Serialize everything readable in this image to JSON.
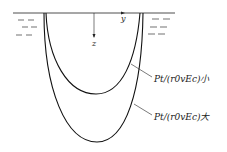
{
  "diagram": {
    "axes": {
      "horizontal": "y",
      "vertical": "z"
    },
    "curves": [
      {
        "label": "P_t/(r_0 v E_c) 小",
        "text": "Pt/(r0vEc)小",
        "description": "shallow inner U-shaped crater profile"
      },
      {
        "label": "P_t/(r_0 v E_c) 大",
        "text": "Pt/(r0vEc)大",
        "description": "deep outer U-shaped crater profile"
      }
    ],
    "surface_marks": "water surface dashes on both sides"
  }
}
